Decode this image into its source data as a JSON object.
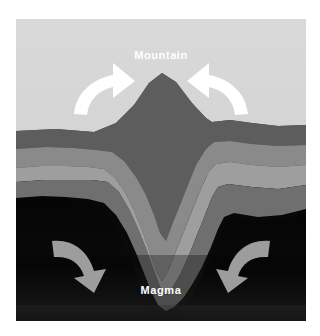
{
  "figure": {
    "type": "geological-cross-section",
    "canvas": {
      "width": 320,
      "height": 336,
      "margin": 16,
      "background": "#ffffff"
    },
    "labels": {
      "mountain": "Mountain",
      "magma": "Magma"
    },
    "colors": {
      "page_background": "#ffffff",
      "sky": "#d6d6d6",
      "sky_bottom": "#cfcfcf",
      "stratum_1_dark_gray": "#5c5c5c",
      "stratum_2_mid_gray": "#878787",
      "stratum_3_light_gray": "#9a9a9a",
      "stratum_4_darker_gray": "#6e6e6e",
      "stratum_5_charcoal": "#3f3f3f",
      "magma": "#080808",
      "magma_glow": "#1a1a1a",
      "arrow_upper": "#ffffff",
      "arrow_lower": "#9d9d9d"
    },
    "arrows": [
      {
        "name": "arrow-upper-left",
        "direction": "up-right",
        "color": "#ffffff",
        "region": "sky"
      },
      {
        "name": "arrow-upper-right",
        "direction": "up-left",
        "color": "#ffffff",
        "region": "sky"
      },
      {
        "name": "arrow-lower-left",
        "direction": "down-right",
        "color": "#9d9d9d",
        "region": "magma"
      },
      {
        "name": "arrow-lower-right",
        "direction": "down-left",
        "color": "#9d9d9d",
        "region": "magma"
      }
    ],
    "strata_count": 5
  }
}
